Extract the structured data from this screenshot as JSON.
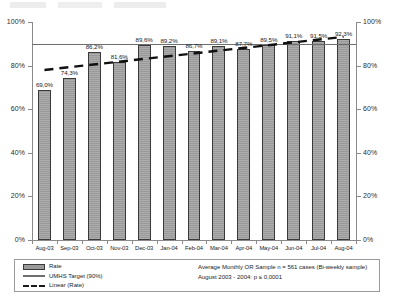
{
  "chart_data": {
    "type": "bar",
    "title": "",
    "xlabel": "",
    "ylabel": "",
    "ylim": [
      0,
      100
    ],
    "ytick_labels": [
      "0%",
      "20%",
      "40%",
      "60%",
      "80%",
      "100%"
    ],
    "ytick_values": [
      0,
      20,
      40,
      60,
      80,
      100
    ],
    "grid": false,
    "legend_position": "bottom",
    "categories": [
      "Aug-03",
      "Sep-03",
      "Oct-03",
      "Nov-03",
      "Dec-03",
      "Jan-04",
      "Feb-04",
      "Mar-04",
      "Apr-04",
      "May-04",
      "Jun-04",
      "Jul-04",
      "Aug-04"
    ],
    "values": [
      69.0,
      74.3,
      86.2,
      81.6,
      89.6,
      89.2,
      86.7,
      89.1,
      87.7,
      89.5,
      91.1,
      91.5,
      92.3
    ],
    "value_labels": [
      "69,0%",
      "74,3%",
      "86,2%",
      "81,6%",
      "89,6%",
      "89,2%",
      "86,7%",
      "89,1%",
      "87,7%",
      "89,5%",
      "91,1%",
      "91,5%",
      "92,3%"
    ],
    "series": [
      {
        "name": "Rate",
        "type": "bar",
        "values": [
          69.0,
          74.3,
          86.2,
          81.6,
          89.6,
          89.2,
          86.7,
          89.1,
          87.7,
          89.5,
          91.1,
          91.5,
          92.3
        ]
      },
      {
        "name": "UMHS Target (90%)",
        "type": "line",
        "constant": 90,
        "values": [
          90,
          90,
          90,
          90,
          90,
          90,
          90,
          90,
          90,
          90,
          90,
          90,
          90
        ]
      },
      {
        "name": "Linear (Rate)",
        "type": "trendline",
        "start": 78.0,
        "end": 93.2,
        "values": [
          78.0,
          79.3,
          80.5,
          81.8,
          83.0,
          84.3,
          85.6,
          86.8,
          88.1,
          89.3,
          90.6,
          91.9,
          93.2
        ]
      }
    ],
    "annotations": [
      "Average Monthly OR Sample n = 561 cases (Bi-weekly sample)",
      "August 2003 - 2004: p ≤ 0,0001"
    ]
  },
  "legend": {
    "items": [
      {
        "label": "Rate",
        "style": "rate",
        "color": "#9a9a9a"
      },
      {
        "label": "UMHS Target (90%)",
        "style": "target",
        "color": "#6e6e6e"
      },
      {
        "label": "Linear (Rate)",
        "style": "linear",
        "color": "#1a1a1a"
      }
    ]
  },
  "notes": {
    "line1": "Average Monthly OR Sample n = 561 cases (Bi-weekly sample)",
    "line2": "August 2003 - 2004: p ≤ 0,0001"
  },
  "axis": {
    "left_ticks": [
      "100%",
      "80%",
      "60%",
      "40%",
      "20%",
      "0%"
    ],
    "right_ticks": [
      "100%",
      "80%",
      "60%",
      "40%",
      "20%",
      "0%"
    ]
  }
}
